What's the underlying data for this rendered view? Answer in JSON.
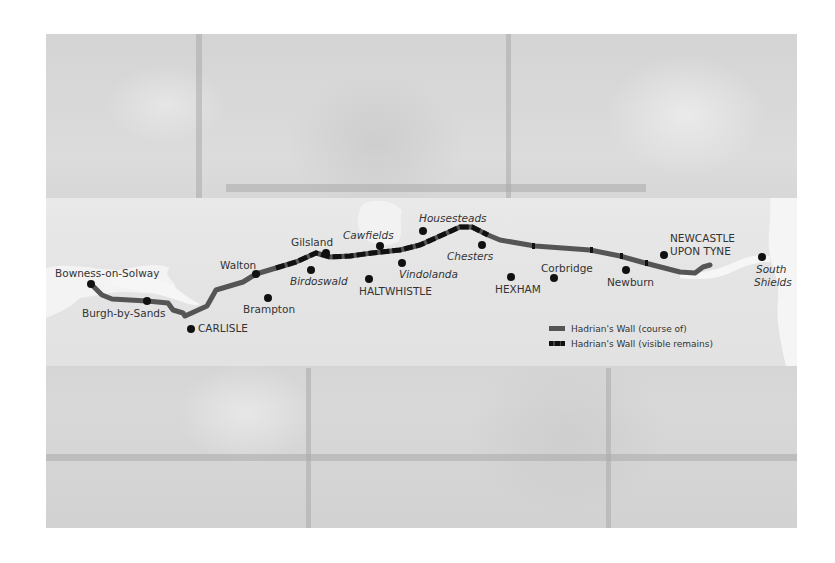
{
  "map": {
    "subject": "Hadrian's Wall",
    "colors": {
      "wall_course": "#555555",
      "wall_visible": "#111111",
      "land": "#e4e4e4",
      "water": "#f4f4f4",
      "dot": "#111111",
      "label": "#333333"
    },
    "places": [
      {
        "name": "Bowness-on-Solway",
        "style": "normal",
        "dot": [
          91,
          284
        ],
        "label_pos": [
          55,
          267
        ]
      },
      {
        "name": "Burgh-by-Sands",
        "style": "normal",
        "dot": [
          147,
          301
        ],
        "label_pos": [
          82,
          307
        ]
      },
      {
        "name": "CARLISLE",
        "style": "normal",
        "dot": [
          191,
          329
        ],
        "label_pos": [
          198,
          322
        ]
      },
      {
        "name": "Walton",
        "style": "normal",
        "dot": [
          256,
          274
        ],
        "label_pos": [
          220,
          259
        ]
      },
      {
        "name": "Brampton",
        "style": "normal",
        "dot": [
          268,
          298
        ],
        "label_pos": [
          243,
          303
        ]
      },
      {
        "name": "Gilsland",
        "style": "normal",
        "dot": [
          326,
          253
        ],
        "label_pos": [
          291,
          236
        ]
      },
      {
        "name": "Birdoswald",
        "style": "italic",
        "dot": [
          311,
          270
        ],
        "label_pos": [
          290,
          275
        ]
      },
      {
        "name": "Cawfields",
        "style": "italic",
        "dot": [
          380,
          246
        ],
        "label_pos": [
          343,
          229
        ]
      },
      {
        "name": "HALTWHISTLE",
        "style": "normal",
        "dot": [
          369,
          279
        ],
        "label_pos": [
          359,
          285
        ]
      },
      {
        "name": "Vindolanda",
        "style": "italic",
        "dot": [
          402,
          263
        ],
        "label_pos": [
          399,
          268
        ]
      },
      {
        "name": "Housesteads",
        "style": "italic",
        "dot": [
          423,
          231
        ],
        "label_pos": [
          419,
          212
        ]
      },
      {
        "name": "Chesters",
        "style": "italic",
        "dot": [
          482,
          245
        ],
        "label_pos": [
          447,
          250
        ]
      },
      {
        "name": "HEXHAM",
        "style": "normal",
        "dot": [
          511,
          277
        ],
        "label_pos": [
          495,
          283
        ]
      },
      {
        "name": "Corbridge",
        "style": "normal",
        "dot": [
          554,
          278
        ],
        "label_pos": [
          541,
          262
        ]
      },
      {
        "name": "Newburn",
        "style": "normal",
        "dot": [
          626,
          270
        ],
        "label_pos": [
          607,
          276
        ]
      },
      {
        "name": "NEWCASTLE",
        "style": "normal",
        "dot": [
          664,
          255
        ],
        "label_pos": [
          670,
          232
        ]
      },
      {
        "name": "UPON TYNE",
        "style": "normal",
        "dot": null,
        "label_pos": [
          670,
          245
        ]
      },
      {
        "name": "South",
        "style": "italic",
        "dot": [
          762,
          257
        ],
        "label_pos": [
          756,
          263
        ]
      },
      {
        "name": "Shields",
        "style": "italic",
        "dot": null,
        "label_pos": [
          754,
          276
        ]
      }
    ],
    "legend": [
      {
        "key": "course",
        "label": "Hadrian's Wall (course of)"
      },
      {
        "key": "visible",
        "label": "Hadrian's Wall (visible remains)"
      }
    ]
  }
}
